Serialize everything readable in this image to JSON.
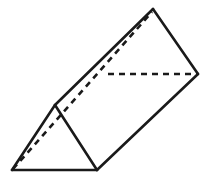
{
  "diagram": {
    "vertices": {
      "front_bottom_left": "A",
      "front_bottom_right": "B",
      "front_top": "C",
      "back_bottom_left": "D",
      "back_bottom_right": "E",
      "back_top": "F"
    },
    "edges": {
      "visible": [
        "A-B",
        "B-C",
        "C-A",
        "C-F",
        "B-E",
        "F-E"
      ],
      "hidden": [
        "A-D",
        "D-E",
        "D-F"
      ]
    },
    "colors": {
      "stroke": "#1a1a1a",
      "background": "#ffffff"
    }
  }
}
